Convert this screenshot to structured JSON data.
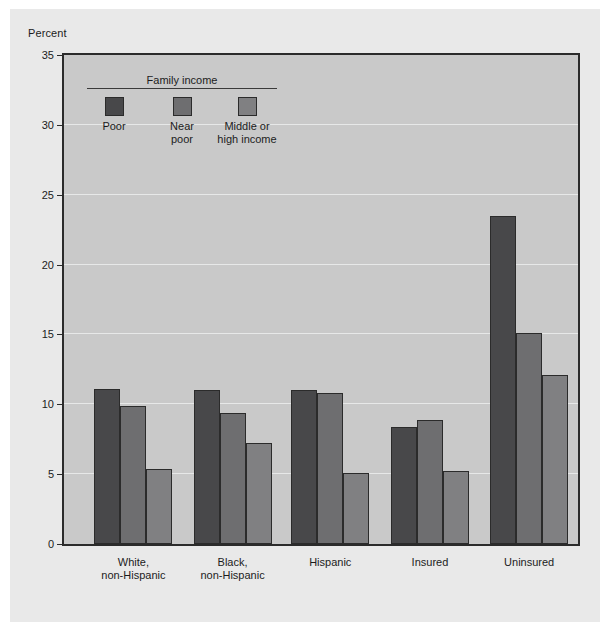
{
  "figure": {
    "background_color": "#e9e9e9",
    "plot_background_color": "#c9c9c9",
    "axis_color": "#2b2b2b",
    "gridline_color": "#eceded"
  },
  "axis_title": "Percent",
  "legend": {
    "title": "Family income",
    "items": [
      {
        "label": "Poor",
        "color": "#48484a"
      },
      {
        "label": "Near\npoor",
        "color": "#6e6e70"
      },
      {
        "label": "Middle or\nhigh income",
        "color": "#808082"
      }
    ]
  },
  "chart_data": {
    "type": "bar",
    "title": "",
    "subtitle": "",
    "xlabel": "",
    "ylabel": "Percent",
    "ylim": [
      0,
      35
    ],
    "yticks": [
      0,
      5,
      10,
      15,
      20,
      25,
      30,
      35
    ],
    "ytick_labels": [
      "0",
      "5",
      "10",
      "15",
      "20",
      "25",
      "30",
      "35"
    ],
    "grid": true,
    "legend_position": "inside-top-left",
    "categories": [
      "White,\nnon-Hispanic",
      "Black,\nnon-Hispanic",
      "Hispanic",
      "Insured",
      "Uninsured"
    ],
    "series": [
      {
        "name": "Poor",
        "color": "#48484a",
        "values": [
          11.1,
          11.0,
          11.0,
          8.4,
          23.5
        ]
      },
      {
        "name": "Near poor",
        "color": "#6e6e70",
        "values": [
          9.9,
          9.4,
          10.8,
          8.9,
          15.1
        ]
      },
      {
        "name": "Middle or high income",
        "color": "#808082",
        "values": [
          5.4,
          7.2,
          5.1,
          5.2,
          12.1
        ]
      }
    ]
  }
}
